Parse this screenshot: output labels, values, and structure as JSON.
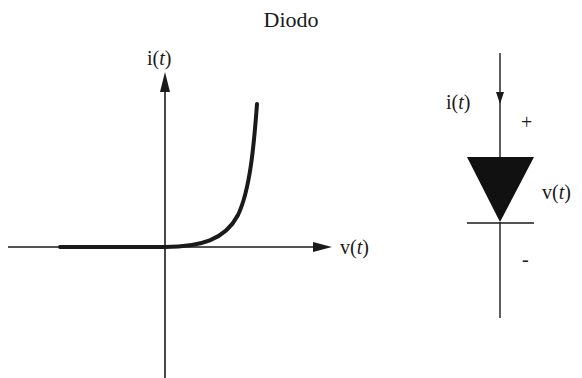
{
  "title": "Diodo",
  "graph": {
    "y_axis_label": "i(",
    "y_axis_var": "t",
    "x_axis_label": "v(",
    "x_axis_var": "t",
    "close_paren": ")"
  },
  "symbol": {
    "current_label": "i(",
    "current_var": "t",
    "voltage_label": "v(",
    "voltage_var": "t",
    "close_paren": ")",
    "plus_sign": "+",
    "minus_sign": "-"
  },
  "colors": {
    "ink": "#1a1a1a"
  }
}
